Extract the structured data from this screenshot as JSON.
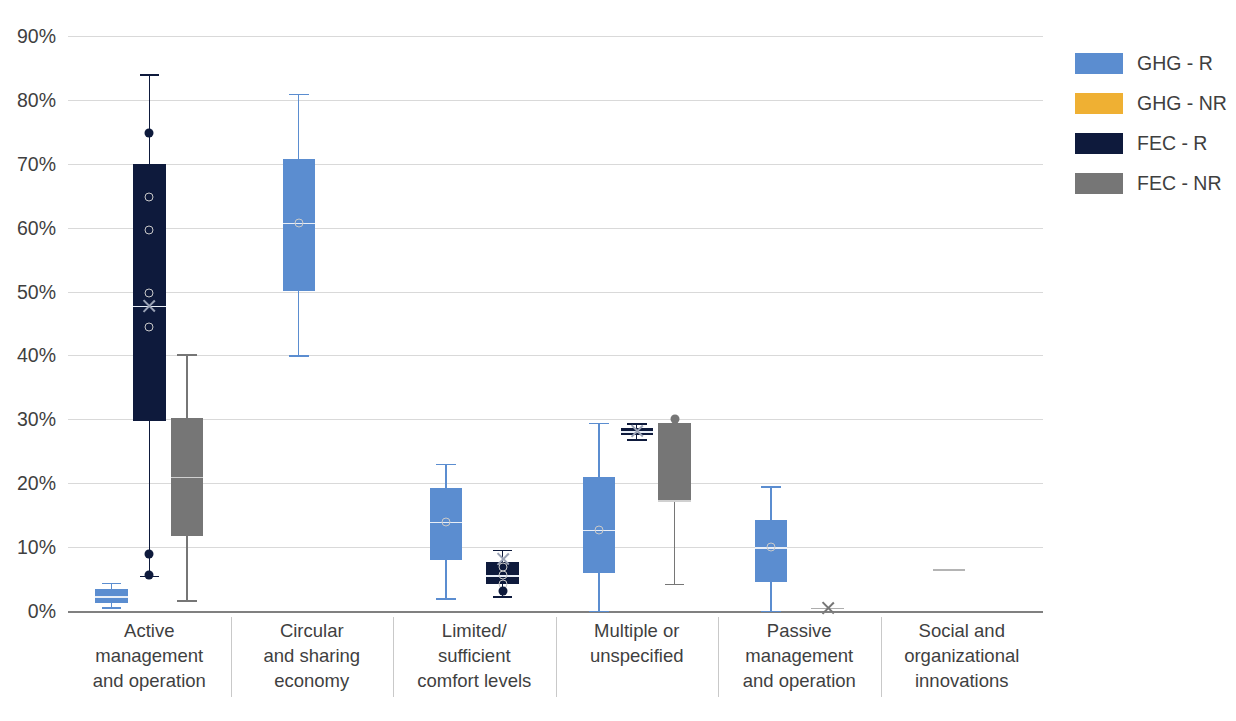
{
  "legend": {
    "position": "right",
    "items": [
      {
        "label": "GHG - R",
        "color": "#5B8DD0"
      },
      {
        "label": "GHG - NR",
        "color": "#EFB033"
      },
      {
        "label": "FEC - R",
        "color": "#0E1A3C"
      },
      {
        "label": "FEC - NR",
        "color": "#767676"
      }
    ]
  },
  "axis": {
    "ylabel": "",
    "xlabel": "",
    "ylim": [
      0,
      90
    ],
    "ytick_labels": [
      "0%",
      "10%",
      "20%",
      "30%",
      "40%",
      "50%",
      "60%",
      "70%",
      "80%",
      "90%"
    ],
    "grid": true
  },
  "categories": [
    {
      "lines": [
        "Active",
        "management",
        "and operation"
      ]
    },
    {
      "lines": [
        "Circular",
        "and sharing",
        "economy"
      ]
    },
    {
      "lines": [
        "Limited/",
        "sufficient",
        "comfort levels"
      ]
    },
    {
      "lines": [
        "Multiple or",
        "unspecified"
      ]
    },
    {
      "lines": [
        "Passive",
        "management",
        "and operation"
      ]
    },
    {
      "lines": [
        "Social and",
        "organizational",
        "innovations"
      ]
    }
  ],
  "chart_data": {
    "type": "box",
    "title": "",
    "xlabel": "",
    "ylabel": "",
    "ylim": [
      0,
      90
    ],
    "yunit": "percent",
    "grid": true,
    "legend_position": "right",
    "categories": [
      "Active management and operation",
      "Circular and sharing economy",
      "Limited/ sufficient comfort levels",
      "Multiple or unspecified",
      "Passive management and operation",
      "Social and organizational innovations"
    ],
    "series": [
      {
        "name": "GHG - R",
        "color": "#5B8DD0",
        "boxes": [
          {
            "category": "Active management and operation",
            "whisker_low": 0.6,
            "q1": 1.2,
            "median": 2.3,
            "q3": 3.5,
            "whisker_high": 4.4,
            "outliers": []
          },
          {
            "category": "Circular and sharing economy",
            "whisker_low": 40.0,
            "q1": 50.1,
            "median": 60.8,
            "q3": 70.8,
            "whisker_high": 81.0,
            "outliers": []
          },
          {
            "category": "Limited/ sufficient comfort levels",
            "whisker_low": 2.0,
            "q1": 8.0,
            "median": 14.0,
            "q3": 19.3,
            "whisker_high": 23.0,
            "outliers": []
          },
          {
            "category": "Multiple or unspecified",
            "whisker_low": 0.0,
            "q1": 6.0,
            "median": 12.7,
            "q3": 21.0,
            "whisker_high": 29.5,
            "outliers": []
          },
          {
            "category": "Passive management and operation",
            "whisker_low": 0.0,
            "q1": 4.5,
            "median": 10.0,
            "q3": 14.3,
            "whisker_high": 19.5,
            "outliers": []
          },
          {
            "category": "Social and organizational innovations",
            "whisker_low": null,
            "q1": null,
            "median": null,
            "q3": null,
            "whisker_high": null,
            "outliers": []
          }
        ]
      },
      {
        "name": "GHG - NR",
        "color": "#EFB033",
        "boxes": [
          {
            "category": "Active management and operation",
            "whisker_low": null,
            "q1": null,
            "median": null,
            "q3": null,
            "whisker_high": null,
            "outliers": []
          },
          {
            "category": "Circular and sharing economy",
            "whisker_low": null,
            "q1": null,
            "median": null,
            "q3": null,
            "whisker_high": null,
            "outliers": []
          },
          {
            "category": "Limited/ sufficient comfort levels",
            "whisker_low": null,
            "q1": null,
            "median": null,
            "q3": null,
            "whisker_high": null,
            "outliers": []
          },
          {
            "category": "Multiple or unspecified",
            "whisker_low": null,
            "q1": null,
            "median": null,
            "q3": null,
            "whisker_high": null,
            "outliers": []
          },
          {
            "category": "Passive management and operation",
            "whisker_low": null,
            "q1": null,
            "median": null,
            "q3": null,
            "whisker_high": null,
            "outliers": []
          },
          {
            "category": "Social and organizational innovations",
            "whisker_low": null,
            "q1": null,
            "median": null,
            "q3": null,
            "whisker_high": null,
            "outliers": []
          }
        ]
      },
      {
        "name": "FEC - R",
        "color": "#0E1A3C",
        "boxes": [
          {
            "category": "Active management and operation",
            "whisker_low": 5.5,
            "q1": 29.8,
            "median": 47.8,
            "q3": 70.0,
            "whisker_high": 84.0,
            "outliers": [
              74.8,
              9.0,
              5.6
            ],
            "mean_marker": 47.8,
            "inner_points": [
              64.8,
              59.6,
              49.8,
              44.5
            ]
          },
          {
            "category": "Circular and sharing economy",
            "whisker_low": null,
            "q1": null,
            "median": null,
            "q3": null,
            "whisker_high": null,
            "outliers": []
          },
          {
            "category": "Limited/ sufficient comfort levels",
            "whisker_low": 2.3,
            "q1": 4.3,
            "median": 5.6,
            "q3": 7.6,
            "whisker_high": 9.6,
            "outliers": [
              3.2
            ],
            "mean_marker": 8.2,
            "inner_points": [
              6.9,
              5.6,
              4.2
            ]
          },
          {
            "category": "Multiple or unspecified",
            "whisker_low": 26.9,
            "q1": 27.6,
            "median": 28.1,
            "q3": 28.7,
            "whisker_high": 29.4,
            "outliers": [],
            "mean_marker": 28.1,
            "inner_points": []
          },
          {
            "category": "Passive management and operation",
            "whisker_low": null,
            "q1": null,
            "median": null,
            "q3": null,
            "whisker_high": null,
            "outliers": []
          },
          {
            "category": "Social and organizational innovations",
            "whisker_low": null,
            "q1": null,
            "median": null,
            "q3": null,
            "whisker_high": null,
            "outliers": []
          }
        ]
      },
      {
        "name": "FEC - NR",
        "color": "#767676",
        "boxes": [
          {
            "category": "Active management and operation",
            "whisker_low": 1.7,
            "q1": 11.8,
            "median": 21.0,
            "q3": 30.2,
            "whisker_high": 40.2,
            "outliers": []
          },
          {
            "category": "Circular and sharing economy",
            "whisker_low": null,
            "q1": null,
            "median": null,
            "q3": null,
            "whisker_high": null,
            "outliers": []
          },
          {
            "category": "Limited/ sufficient comfort levels",
            "whisker_low": null,
            "q1": null,
            "median": null,
            "q3": null,
            "whisker_high": null,
            "outliers": []
          },
          {
            "category": "Multiple or unspecified",
            "whisker_low": 4.3,
            "q1": 17.3,
            "median": 17.3,
            "q3": 29.4,
            "whisker_high": 29.4,
            "outliers": [
              30.1
            ]
          },
          {
            "category": "Passive management and operation",
            "whisker_low": null,
            "q1": null,
            "median": null,
            "q3": null,
            "whisker_high": null,
            "outliers": [],
            "x_marker": 0.5
          },
          {
            "category": "Social and organizational innovations",
            "whisker_low": null,
            "q1": null,
            "median": null,
            "q3": null,
            "whisker_high": null,
            "outliers": [],
            "flat_value": 6.5
          }
        ]
      }
    ]
  }
}
